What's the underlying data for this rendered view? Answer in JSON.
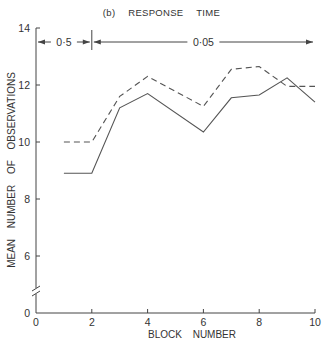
{
  "chart_data": {
    "type": "line",
    "title": "(b)   RESPONSE   TIME",
    "xlabel": "BLOCK NUMBER",
    "ylabel": "MEAN NUMBER OF OBSERVATIONS",
    "xlim": [
      0,
      10
    ],
    "ylim": [
      0,
      14
    ],
    "y_axis_break": "between 0 and 6",
    "xticks": [
      0,
      2,
      4,
      6,
      8,
      10
    ],
    "yticks": [
      0,
      6,
      8,
      10,
      12,
      14
    ],
    "grid": false,
    "legend": "none",
    "x": [
      1,
      2,
      3,
      4,
      6,
      7,
      8,
      9,
      10
    ],
    "series": [
      {
        "name": "solid",
        "style": "solid",
        "values": [
          8.9,
          8.9,
          11.2,
          11.7,
          10.35,
          11.55,
          11.65,
          12.25,
          11.4
        ]
      },
      {
        "name": "dashed",
        "style": "dashed",
        "values": [
          10.0,
          10.0,
          11.6,
          12.3,
          11.25,
          12.55,
          12.65,
          11.95,
          11.95
        ]
      }
    ],
    "annotations": [
      {
        "text": "0·5",
        "span": [
          0,
          2
        ],
        "type": "double-arrow"
      },
      {
        "text": "0·05",
        "span": [
          2,
          10
        ],
        "type": "double-arrow"
      }
    ]
  },
  "labels": {
    "title": "(b) RESPONSE TIME",
    "xlabel": "BLOCK NUMBER",
    "ylabel": "MEAN NUMBER OF OBSERVATIONS",
    "ann1": "0·5",
    "ann2": "0·05"
  },
  "colors": {
    "line": "#555555",
    "axis": "#444444"
  }
}
